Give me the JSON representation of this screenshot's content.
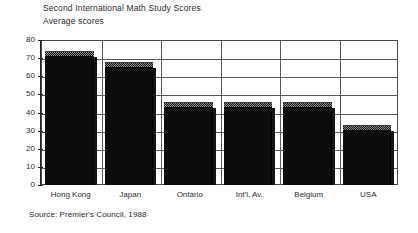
{
  "chart_data": {
    "type": "bar",
    "title": "Second International Math Study Scores",
    "subtitle": "Average scores",
    "xlabel": "",
    "ylabel": "",
    "categories": [
      "Hong Kong",
      "Japan",
      "Ontario",
      "Int'l. Av.",
      "Belgium",
      "USA"
    ],
    "values": [
      74,
      68,
      46,
      46,
      46,
      33
    ],
    "ylim": [
      0,
      80
    ],
    "yticks": [
      0,
      10,
      20,
      30,
      40,
      50,
      60,
      70,
      80
    ],
    "ytick_labels": [
      "0",
      "10",
      "20",
      "30",
      "40",
      "50",
      "60",
      "70",
      "80"
    ],
    "grid": true,
    "legend": false,
    "series": [
      {
        "name": "Average scores",
        "values": [
          74,
          68,
          46,
          46,
          46,
          33
        ]
      }
    ],
    "bar_style": "3d-monochrome",
    "colors": {
      "bar_face": "#0c0c0c",
      "bar_top": "#8e8e8e",
      "grid": "#5a5a5a",
      "axis": "#222222",
      "text": "#2b2b2b",
      "background": "#ffffff"
    }
  },
  "source": "Source: Premier's Council, 1988"
}
